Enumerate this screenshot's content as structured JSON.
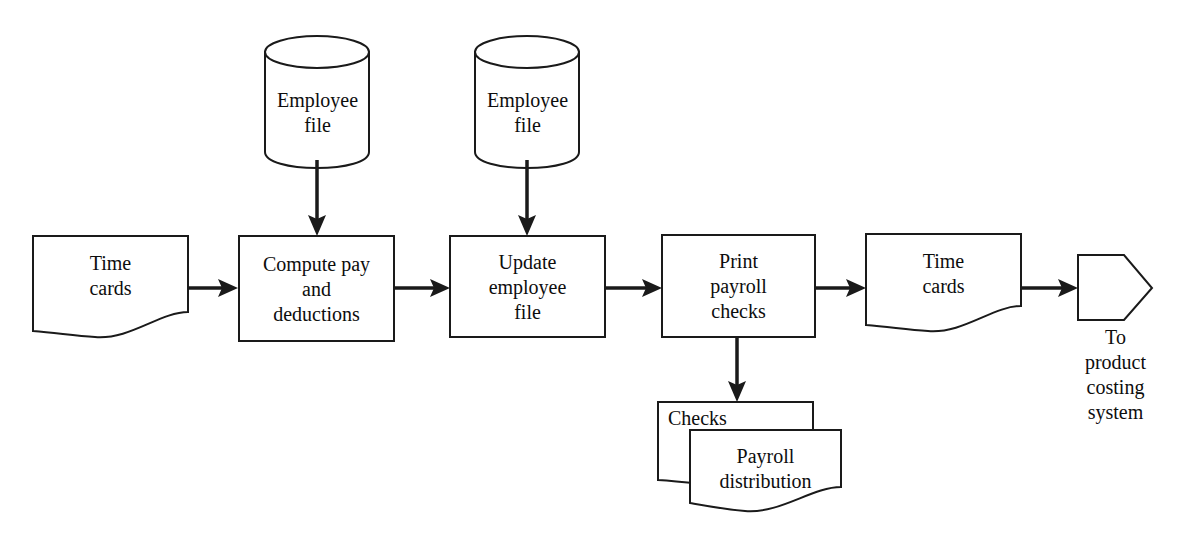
{
  "diagram": {
    "accent_color": "#1a1a1a",
    "background_color": "#ffffff",
    "nodes": [
      {
        "id": "time-cards-input",
        "type": "document",
        "label": "Time\ncards"
      },
      {
        "id": "employee-file-1",
        "type": "database",
        "label": "Employee\nfile"
      },
      {
        "id": "compute-pay",
        "type": "process",
        "label": "Compute pay\nand\ndeductions"
      },
      {
        "id": "employee-file-2",
        "type": "database",
        "label": "Employee\nfile"
      },
      {
        "id": "update-employee-file",
        "type": "process",
        "label": "Update\nemployee\nfile"
      },
      {
        "id": "print-payroll-checks",
        "type": "process",
        "label": "Print\npayroll\nchecks"
      },
      {
        "id": "time-cards-output",
        "type": "document",
        "label": "Time\ncards"
      },
      {
        "id": "to-product-costing",
        "type": "connector",
        "label": "To\nproduct\ncosting\nsystem"
      },
      {
        "id": "checks-doc",
        "type": "document",
        "label": "Checks"
      },
      {
        "id": "payroll-distribution",
        "type": "document",
        "label": "Payroll\ndistribution"
      }
    ],
    "connectors": [
      {
        "id": "conn-timecards-to-compute",
        "from": "time-cards-input",
        "to": "compute-pay",
        "direction": "right"
      },
      {
        "id": "conn-empfile1-to-compute",
        "from": "employee-file-1",
        "to": "compute-pay",
        "direction": "down"
      },
      {
        "id": "conn-compute-to-update",
        "from": "compute-pay",
        "to": "update-employee-file",
        "direction": "right"
      },
      {
        "id": "conn-empfile2-to-update",
        "from": "employee-file-2",
        "to": "update-employee-file",
        "direction": "down"
      },
      {
        "id": "conn-update-to-print",
        "from": "update-employee-file",
        "to": "print-payroll-checks",
        "direction": "right"
      },
      {
        "id": "conn-print-to-timecards",
        "from": "print-payroll-checks",
        "to": "time-cards-output",
        "direction": "right"
      },
      {
        "id": "conn-timecards-to-connector",
        "from": "time-cards-output",
        "to": "to-product-costing",
        "direction": "right"
      },
      {
        "id": "conn-print-to-checks",
        "from": "print-payroll-checks",
        "to": "checks-doc",
        "direction": "down"
      }
    ]
  }
}
